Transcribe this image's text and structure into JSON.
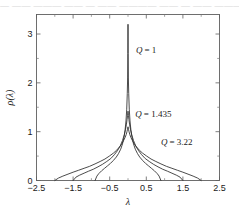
{
  "figure": {
    "page_bleed_text": "— —— ——— —— — —— ———— —— — —— ——— —— ——"
  },
  "chart_data": {
    "type": "line",
    "title": "",
    "xlabel": "λ",
    "ylabel": "ρ(λ)",
    "xlim": [
      -2.5,
      2.5
    ],
    "ylim": [
      0,
      3.4
    ],
    "grid": false,
    "legend_position": "inline-annotations",
    "x_ticks": [
      -2.5,
      -1.5,
      -0.5,
      0.5,
      1.5,
      2.5
    ],
    "x_tick_labels": [
      "-2.5",
      "-1.5",
      "-0.5",
      "0.5",
      "1.5",
      "2.5"
    ],
    "x_minor_ticks": [
      -2.0,
      -1.0,
      0.0,
      1.0,
      2.0
    ],
    "y_ticks": [
      0,
      1,
      2,
      3
    ],
    "y_tick_labels": [
      "0",
      "1",
      "2",
      "3"
    ],
    "y_minor_ticks": [
      0.5,
      1.5,
      2.5
    ],
    "annotations": [
      {
        "text": "Q = 1",
        "symbol": "Q",
        "value": "= 1",
        "x": 0.22,
        "y": 2.62
      },
      {
        "text": "Q = 1.435",
        "symbol": "Q",
        "value": "= 1.435",
        "x": 0.2,
        "y": 1.3
      },
      {
        "text": "Q = 3.22",
        "symbol": "Q",
        "value": "= 3.22",
        "x": 0.9,
        "y": 0.72
      }
    ],
    "series": [
      {
        "name": "Q = 1",
        "Q": 1,
        "support": [
          -0.9,
          0.9
        ],
        "peak": 3.2,
        "x": [
          -0.9,
          -0.85,
          -0.8,
          -0.72,
          -0.64,
          -0.56,
          -0.48,
          -0.4,
          -0.32,
          -0.26,
          -0.2,
          -0.15,
          -0.11,
          -0.08,
          -0.055,
          -0.035,
          -0.02,
          -0.01,
          -0.004,
          0,
          0.004,
          0.01,
          0.02,
          0.035,
          0.055,
          0.08,
          0.11,
          0.15,
          0.2,
          0.26,
          0.32,
          0.4,
          0.48,
          0.56,
          0.64,
          0.72,
          0.8,
          0.85,
          0.9
        ],
        "y": [
          0,
          0.09,
          0.14,
          0.2,
          0.25,
          0.3,
          0.35,
          0.41,
          0.48,
          0.55,
          0.64,
          0.75,
          0.88,
          1.03,
          1.22,
          1.46,
          1.78,
          2.1,
          2.6,
          3.2,
          2.6,
          2.1,
          1.78,
          1.46,
          1.22,
          1.03,
          0.88,
          0.75,
          0.64,
          0.55,
          0.48,
          0.41,
          0.35,
          0.3,
          0.25,
          0.2,
          0.14,
          0.09,
          0
        ]
      },
      {
        "name": "Q = 1.435",
        "Q": 1.435,
        "support": [
          -1.5,
          1.5
        ],
        "peak": 1.42,
        "x": [
          -1.5,
          -1.42,
          -1.32,
          -1.2,
          -1.08,
          -0.95,
          -0.82,
          -0.7,
          -0.58,
          -0.47,
          -0.37,
          -0.28,
          -0.21,
          -0.15,
          -0.1,
          -0.07,
          -0.045,
          -0.025,
          -0.012,
          0,
          0.012,
          0.025,
          0.045,
          0.07,
          0.1,
          0.15,
          0.21,
          0.28,
          0.37,
          0.47,
          0.58,
          0.7,
          0.82,
          0.95,
          1.08,
          1.2,
          1.32,
          1.42,
          1.5
        ],
        "y": [
          0,
          0.07,
          0.11,
          0.15,
          0.19,
          0.23,
          0.28,
          0.33,
          0.39,
          0.45,
          0.53,
          0.62,
          0.71,
          0.82,
          0.94,
          1.04,
          1.14,
          1.25,
          1.33,
          1.42,
          1.33,
          1.25,
          1.14,
          1.04,
          0.94,
          0.82,
          0.71,
          0.62,
          0.53,
          0.45,
          0.39,
          0.33,
          0.28,
          0.23,
          0.19,
          0.15,
          0.11,
          0.07,
          0
        ]
      },
      {
        "name": "Q = 3.22",
        "Q": 3.22,
        "support": [
          -2.0,
          2.0
        ],
        "peak": 1.1,
        "x": [
          -2.0,
          -1.9,
          -1.78,
          -1.64,
          -1.5,
          -1.35,
          -1.2,
          -1.05,
          -0.9,
          -0.76,
          -0.63,
          -0.51,
          -0.4,
          -0.31,
          -0.23,
          -0.17,
          -0.12,
          -0.08,
          -0.05,
          -0.028,
          -0.013,
          0,
          0.013,
          0.028,
          0.05,
          0.08,
          0.12,
          0.17,
          0.23,
          0.31,
          0.4,
          0.51,
          0.63,
          0.76,
          0.9,
          1.05,
          1.2,
          1.35,
          1.5,
          1.64,
          1.78,
          1.9,
          2.0
        ],
        "y": [
          0,
          0.05,
          0.09,
          0.13,
          0.17,
          0.21,
          0.25,
          0.29,
          0.34,
          0.39,
          0.44,
          0.5,
          0.56,
          0.62,
          0.69,
          0.75,
          0.82,
          0.88,
          0.94,
          1.0,
          1.05,
          1.1,
          1.05,
          1.0,
          0.94,
          0.88,
          0.82,
          0.75,
          0.69,
          0.62,
          0.56,
          0.5,
          0.44,
          0.39,
          0.34,
          0.29,
          0.25,
          0.21,
          0.17,
          0.13,
          0.09,
          0.05,
          0
        ]
      }
    ]
  }
}
